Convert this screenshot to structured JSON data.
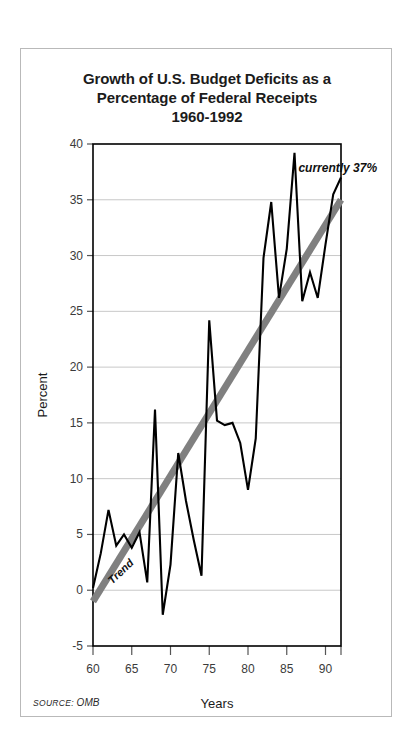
{
  "figure": {
    "title_lines": [
      "Growth of U.S. Budget Deficits as a",
      "Percentage of Federal Receipts",
      "1960-1992"
    ],
    "source_prefix": "SOURCE:",
    "source_value": "OMB",
    "frame_color": "#b9b9b9",
    "background": "#ffffff"
  },
  "chart_data": {
    "type": "line",
    "title": "Growth of U.S. Budget Deficits as a Percentage of Federal Receipts 1960-1992",
    "xlabel": "Years",
    "ylabel": "Percent",
    "xlim": [
      60,
      92
    ],
    "ylim": [
      -5,
      40
    ],
    "grid": "horizontal",
    "legend": "none",
    "series_color": "#000000",
    "trend_color": "#808080",
    "yticks": [
      -5,
      0,
      5,
      10,
      15,
      20,
      25,
      30,
      35,
      40
    ],
    "ytick_labels": [
      "-5",
      "0",
      "5",
      "10",
      "15",
      "20",
      "25",
      "30",
      "35",
      "40"
    ],
    "xticks": [
      60,
      65,
      70,
      75,
      80,
      85,
      90
    ],
    "xtick_labels": [
      "60",
      "65",
      "70",
      "75",
      "80",
      "85",
      "90"
    ],
    "x": [
      60,
      61,
      62,
      63,
      64,
      65,
      66,
      67,
      68,
      69,
      70,
      71,
      72,
      73,
      74,
      75,
      76,
      77,
      78,
      79,
      80,
      81,
      82,
      83,
      84,
      85,
      86,
      87,
      88,
      89,
      90,
      91,
      92
    ],
    "values": [
      0.2,
      3.3,
      7.2,
      4.0,
      5.0,
      3.8,
      5.2,
      0.7,
      16.2,
      -2.2,
      2.3,
      12.3,
      8.0,
      4.5,
      1.3,
      24.2,
      15.2,
      14.8,
      15.0,
      13.2,
      9.0,
      13.6,
      29.8,
      34.8,
      26.2,
      30.6,
      39.2,
      25.9,
      28.5,
      26.2,
      31.0,
      35.5,
      37.0
    ],
    "series": [
      {
        "name": "Deficit as % of receipts",
        "values": [
          0.2,
          3.3,
          7.2,
          4.0,
          5.0,
          3.8,
          5.2,
          0.7,
          16.2,
          -2.2,
          2.3,
          12.3,
          8.0,
          4.5,
          1.3,
          24.2,
          15.2,
          14.8,
          15.0,
          13.2,
          9.0,
          13.6,
          29.8,
          34.8,
          26.2,
          30.6,
          39.2,
          25.9,
          28.5,
          26.2,
          31.0,
          35.5,
          37.0
        ]
      },
      {
        "name": "Trend",
        "type": "trendline",
        "x": [
          60,
          92
        ],
        "values": [
          -1.0,
          35.0
        ]
      }
    ],
    "annotations": [
      {
        "name": "currently-37-percent",
        "text": "currently 37%",
        "x": 86.5,
        "y": 37.5
      },
      {
        "name": "trend-label",
        "text": "Trend",
        "x": 62.5,
        "y": 0.5,
        "rotation": -44
      }
    ]
  }
}
